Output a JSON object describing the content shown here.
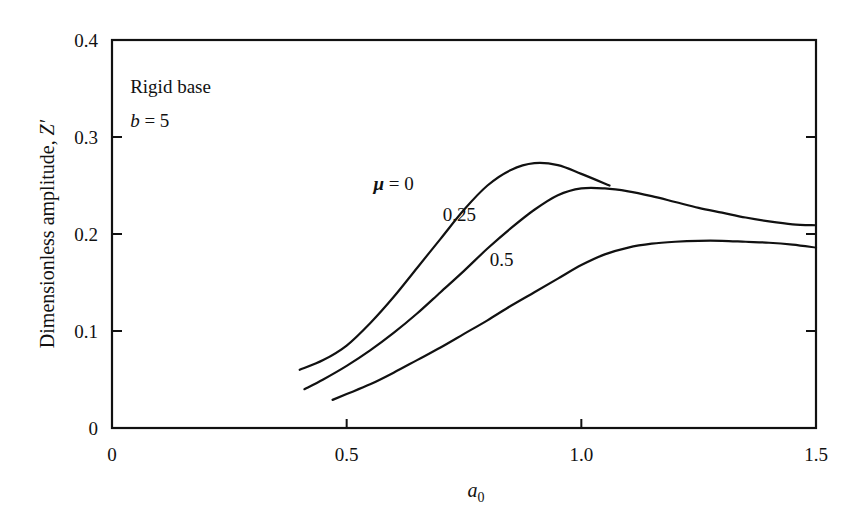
{
  "chart_data": {
    "type": "line",
    "title": "",
    "xlabel": "a₀",
    "xlabel_base": "a",
    "xlabel_sub": "0",
    "ylabel": "Dimensionless amplitude, Z′",
    "xlim": [
      0,
      1.5
    ],
    "ylim": [
      0,
      0.4
    ],
    "grid": false,
    "legend": "inline curve labels",
    "x_ticks": [
      0,
      0.5,
      1.0,
      1.5
    ],
    "x_tick_labels": [
      "0",
      "0.5",
      "1.0",
      "1.5"
    ],
    "y_ticks": [
      0,
      0.1,
      0.2,
      0.3,
      0.4
    ],
    "y_tick_labels": [
      "0",
      "0.1",
      "0.2",
      "0.3",
      "0.4"
    ],
    "annotations": [
      {
        "text": "Rigid base",
        "x": 0.06,
        "y": 0.345
      },
      {
        "text": "b = 5",
        "x": 0.06,
        "y": 0.31
      }
    ],
    "series": [
      {
        "name": "μ = 0",
        "label": "μ = 0",
        "label_pos": [
          0.6,
          0.245
        ],
        "x": [
          0.4,
          0.45,
          0.5,
          0.55,
          0.6,
          0.65,
          0.7,
          0.75,
          0.8,
          0.85,
          0.9,
          0.95,
          1.0,
          1.06
        ],
        "y": [
          0.06,
          0.07,
          0.085,
          0.108,
          0.135,
          0.165,
          0.195,
          0.225,
          0.25,
          0.266,
          0.273,
          0.271,
          0.262,
          0.25
        ]
      },
      {
        "name": "μ = 0.25",
        "label": "0.25",
        "label_pos": [
          0.74,
          0.213
        ],
        "x": [
          0.41,
          0.45,
          0.5,
          0.55,
          0.6,
          0.65,
          0.7,
          0.75,
          0.8,
          0.85,
          0.9,
          0.95,
          1.0,
          1.05,
          1.1,
          1.15,
          1.2,
          1.25,
          1.3,
          1.35,
          1.4,
          1.45,
          1.5
        ],
        "y": [
          0.04,
          0.05,
          0.064,
          0.08,
          0.098,
          0.118,
          0.14,
          0.162,
          0.185,
          0.206,
          0.225,
          0.24,
          0.247,
          0.247,
          0.244,
          0.239,
          0.233,
          0.227,
          0.222,
          0.217,
          0.213,
          0.21,
          0.209
        ]
      },
      {
        "name": "μ = 0.5",
        "label": "0.5",
        "label_pos": [
          0.83,
          0.167
        ],
        "x": [
          0.47,
          0.5,
          0.55,
          0.6,
          0.65,
          0.7,
          0.75,
          0.8,
          0.85,
          0.9,
          0.95,
          1.0,
          1.05,
          1.1,
          1.15,
          1.2,
          1.25,
          1.3,
          1.35,
          1.4,
          1.45,
          1.5
        ],
        "y": [
          0.029,
          0.035,
          0.045,
          0.057,
          0.07,
          0.083,
          0.097,
          0.111,
          0.126,
          0.14,
          0.154,
          0.168,
          0.179,
          0.186,
          0.19,
          0.192,
          0.193,
          0.193,
          0.192,
          0.191,
          0.189,
          0.186
        ]
      }
    ],
    "extra_marks": [
      {
        "type": "tick",
        "axis": "right",
        "y": 0.2
      }
    ]
  }
}
